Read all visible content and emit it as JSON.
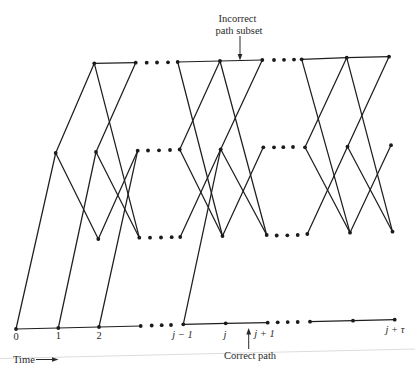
{
  "figure": {
    "annotations": {
      "incorrect_subset_line1": "Incorrect",
      "incorrect_subset_line2": "path subset",
      "correct_path": "Correct path",
      "time_axis": "Time"
    },
    "time_labels": [
      {
        "text": "0",
        "x": 16,
        "y": 339.5,
        "italic": false
      },
      {
        "text": "1",
        "x": 58.3,
        "y": 339,
        "italic": false
      },
      {
        "text": "2",
        "x": 99,
        "y": 338.5,
        "italic": false
      },
      {
        "text": "j − 1",
        "x": 182.5,
        "y": 338,
        "italic": true
      },
      {
        "text": "j",
        "x": 225,
        "y": 337.5,
        "italic": true
      },
      {
        "text": "j + 1",
        "x": 264.5,
        "y": 337,
        "italic": true
      },
      {
        "text": "j + τ",
        "x": 395,
        "y": 333,
        "italic": true
      }
    ],
    "colors": {
      "ink": "#1f1f1f",
      "paper": "#ffffff",
      "scan_artifact": "#dcdcdc"
    },
    "nodes": {
      "s1_B0": [
        16,
        329
      ],
      "s1_B1": [
        58.3,
        328
      ],
      "s1_B2": [
        99,
        327
      ],
      "s1_B3": [
        140.7,
        326
      ],
      "s1_M1": [
        55.7,
        153
      ],
      "s1_M2": [
        96,
        152
      ],
      "s1_M3": [
        137.7,
        150.7
      ],
      "s1_T2": [
        94.3,
        63.3
      ],
      "s1_T3": [
        135.7,
        62.7
      ],
      "s1_L2": [
        98.3,
        239
      ],
      "s1_L3": [
        139.3,
        237.7
      ],
      "s2_T0": [
        177.7,
        62
      ],
      "s2_T1": [
        220,
        61
      ],
      "s2_T2": [
        262.3,
        60
      ],
      "s2_M0": [
        179.7,
        149.5
      ],
      "s2_M1": [
        220.7,
        149.3
      ],
      "s2_M2": [
        263.3,
        147.3
      ],
      "s2_L0": [
        180.2,
        237
      ],
      "s2_L1": [
        222.5,
        236
      ],
      "s2_L2": [
        266.7,
        235
      ],
      "s2_B0": [
        183.3,
        324.3
      ],
      "s2_B1": [
        225.7,
        323.3
      ],
      "s2_B2": [
        267.7,
        322.7
      ],
      "s3_T0": [
        301.7,
        59.3
      ],
      "s3_T1": [
        346.7,
        57.7
      ],
      "s3_T2": [
        389,
        56.7
      ],
      "s3_M0": [
        305,
        147.3
      ],
      "s3_M1": [
        347.5,
        146.7
      ],
      "s3_M2": [
        391,
        145.2
      ],
      "s3_L0": [
        307.3,
        234
      ],
      "s3_L1": [
        350,
        232.7
      ],
      "s3_L2": [
        392.5,
        231.7
      ],
      "s3_B0": [
        310,
        321.7
      ],
      "s3_B1": [
        353,
        320.7
      ],
      "s3_B2": [
        394.7,
        319.7
      ]
    },
    "correct_path_edges": [
      [
        "s1_B0",
        "s1_B1"
      ],
      [
        "s1_B1",
        "s1_B2"
      ],
      [
        "s1_B2",
        "s1_B3"
      ],
      [
        "s2_B0",
        "s2_B1"
      ],
      [
        "s2_B1",
        "s2_B2"
      ],
      [
        "s3_B0",
        "s3_B1"
      ],
      [
        "s3_B1",
        "s3_B2"
      ]
    ],
    "branch_edges": [
      [
        "s1_B0",
        "s1_M1"
      ],
      [
        "s1_M1",
        "s1_T2"
      ],
      [
        "s1_M1",
        "s1_L2"
      ],
      [
        "s1_B1",
        "s1_M2"
      ],
      [
        "s1_T2",
        "s1_T3"
      ],
      [
        "s1_T2",
        "s1_L3"
      ],
      [
        "s1_M2",
        "s1_T3"
      ],
      [
        "s1_M2",
        "s1_L3"
      ],
      [
        "s1_L2",
        "s1_M3"
      ],
      [
        "s1_B2",
        "s1_M3"
      ],
      [
        "s2_T0",
        "s2_T1"
      ],
      [
        "s2_T0",
        "s2_L1"
      ],
      [
        "s2_M0",
        "s2_T1"
      ],
      [
        "s2_M0",
        "s2_L1"
      ],
      [
        "s2_L0",
        "s2_M1"
      ],
      [
        "s2_B0",
        "s2_M1"
      ],
      [
        "s2_T1",
        "s2_T2"
      ],
      [
        "s2_T1",
        "s2_L2"
      ],
      [
        "s2_M1",
        "s2_T2"
      ],
      [
        "s2_M1",
        "s2_L2"
      ],
      [
        "s2_L1",
        "s2_M2"
      ],
      [
        "s3_T0",
        "s3_T1"
      ],
      [
        "s3_T0",
        "s3_L1"
      ],
      [
        "s3_M0",
        "s3_T1"
      ],
      [
        "s3_M0",
        "s3_L1"
      ],
      [
        "s3_L0",
        "s3_M1"
      ],
      [
        "s3_T1",
        "s3_T2"
      ],
      [
        "s3_T1",
        "s3_L2"
      ],
      [
        "s3_M1",
        "s3_T2"
      ],
      [
        "s3_M1",
        "s3_L2"
      ],
      [
        "s3_L1",
        "s3_M2"
      ]
    ],
    "ellipsis_dots": [
      [
        146.7,
        62.7
      ],
      [
        157,
        62.5
      ],
      [
        168,
        62.3
      ],
      [
        148,
        150.5
      ],
      [
        159,
        150.3
      ],
      [
        170,
        150
      ],
      [
        150,
        237.7
      ],
      [
        161,
        237.5
      ],
      [
        171.7,
        237.2
      ],
      [
        151.7,
        325.5
      ],
      [
        161.7,
        325.2
      ],
      [
        171,
        325
      ],
      [
        274,
        60
      ],
      [
        284,
        59.8
      ],
      [
        294,
        59.6
      ],
      [
        274,
        147.3
      ],
      [
        283.3,
        147.2
      ],
      [
        293,
        147
      ],
      [
        276.7,
        235.5
      ],
      [
        287.3,
        235.3
      ],
      [
        297.7,
        235
      ],
      [
        277.7,
        322.3
      ],
      [
        287.7,
        322.1
      ],
      [
        297.7,
        322
      ]
    ]
  }
}
